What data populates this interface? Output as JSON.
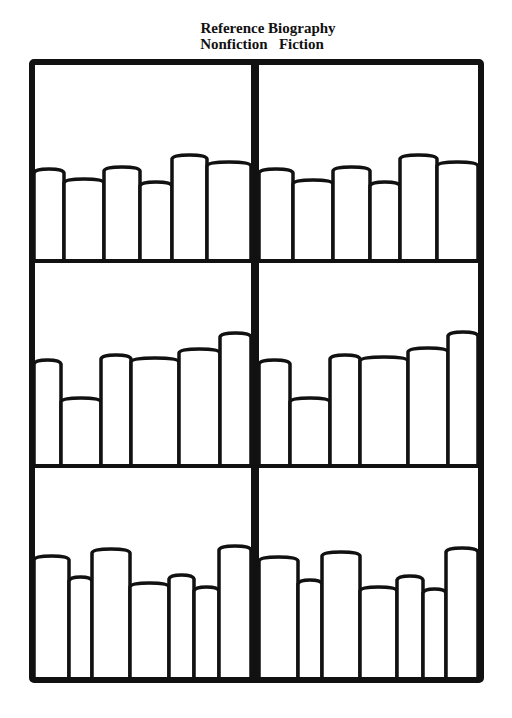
{
  "header": {
    "line1": [
      "Reference",
      "Biography"
    ],
    "line2": [
      "Nonfiction",
      "Fiction"
    ]
  },
  "colors": {
    "ink": "#111111",
    "paper": "#ffffff"
  },
  "bookcase": {
    "frame": {
      "left": 32,
      "top": 62,
      "right": 481,
      "bottom": 680,
      "stroke": 6
    },
    "center_divider_x": 255,
    "center_divider_width": 8,
    "shelves_y": [
      261,
      466
    ],
    "shelf_stroke": 4,
    "book_stroke": 3.5,
    "rows": [
      {
        "base_y": 261,
        "left_books": [
          {
            "x1": 34,
            "x2": 64,
            "top": 170
          },
          {
            "x1": 64,
            "x2": 104,
            "top": 180
          },
          {
            "x1": 104,
            "x2": 140,
            "top": 168
          },
          {
            "x1": 140,
            "x2": 172,
            "top": 183
          },
          {
            "x1": 172,
            "x2": 207,
            "top": 156
          },
          {
            "x1": 207,
            "x2": 251,
            "top": 163
          }
        ],
        "right_books": [
          {
            "x1": 259,
            "x2": 293,
            "top": 170
          },
          {
            "x1": 293,
            "x2": 333,
            "top": 181
          },
          {
            "x1": 333,
            "x2": 370,
            "top": 168
          },
          {
            "x1": 370,
            "x2": 400,
            "top": 183
          },
          {
            "x1": 400,
            "x2": 437,
            "top": 156
          },
          {
            "x1": 437,
            "x2": 478,
            "top": 163
          }
        ]
      },
      {
        "base_y": 466,
        "left_books": [
          {
            "x1": 34,
            "x2": 61,
            "top": 361
          },
          {
            "x1": 61,
            "x2": 101,
            "top": 399
          },
          {
            "x1": 101,
            "x2": 131,
            "top": 356
          },
          {
            "x1": 131,
            "x2": 179,
            "top": 359
          },
          {
            "x1": 179,
            "x2": 220,
            "top": 350
          },
          {
            "x1": 220,
            "x2": 251,
            "top": 334
          }
        ],
        "right_books": [
          {
            "x1": 259,
            "x2": 290,
            "top": 361
          },
          {
            "x1": 290,
            "x2": 330,
            "top": 399
          },
          {
            "x1": 330,
            "x2": 360,
            "top": 356
          },
          {
            "x1": 360,
            "x2": 408,
            "top": 358
          },
          {
            "x1": 408,
            "x2": 448,
            "top": 349
          },
          {
            "x1": 448,
            "x2": 478,
            "top": 333
          }
        ]
      },
      {
        "base_y": 679,
        "left_books": [
          {
            "x1": 34,
            "x2": 69,
            "top": 557
          },
          {
            "x1": 69,
            "x2": 92,
            "top": 578
          },
          {
            "x1": 92,
            "x2": 130,
            "top": 550
          },
          {
            "x1": 130,
            "x2": 169,
            "top": 584
          },
          {
            "x1": 169,
            "x2": 194,
            "top": 576
          },
          {
            "x1": 194,
            "x2": 219,
            "top": 588
          },
          {
            "x1": 219,
            "x2": 251,
            "top": 547
          }
        ],
        "right_books": [
          {
            "x1": 259,
            "x2": 298,
            "top": 558
          },
          {
            "x1": 298,
            "x2": 322,
            "top": 581
          },
          {
            "x1": 322,
            "x2": 360,
            "top": 553
          },
          {
            "x1": 360,
            "x2": 397,
            "top": 588
          },
          {
            "x1": 397,
            "x2": 423,
            "top": 577
          },
          {
            "x1": 423,
            "x2": 446,
            "top": 590
          },
          {
            "x1": 446,
            "x2": 478,
            "top": 549
          }
        ]
      }
    ]
  }
}
